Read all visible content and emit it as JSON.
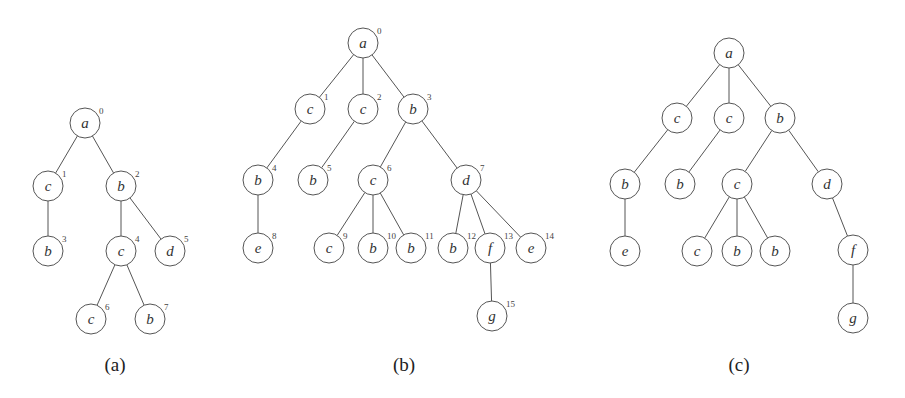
{
  "figure": {
    "node_radius": 15,
    "colors": {
      "stroke": "#555555",
      "text": "#333333",
      "background": "#ffffff"
    },
    "trees": [
      {
        "id": "a",
        "caption": "(a)",
        "caption_pos": [
          115,
          364
        ],
        "nodes": [
          {
            "id": "a0",
            "label": "a",
            "index": "0",
            "x": 85,
            "y": 123
          },
          {
            "id": "a1",
            "label": "c",
            "index": "1",
            "x": 48,
            "y": 186
          },
          {
            "id": "a2",
            "label": "b",
            "index": "2",
            "x": 121,
            "y": 186
          },
          {
            "id": "a3",
            "label": "b",
            "index": "3",
            "x": 48,
            "y": 251
          },
          {
            "id": "a4",
            "label": "c",
            "index": "4",
            "x": 121,
            "y": 251
          },
          {
            "id": "a5",
            "label": "d",
            "index": "5",
            "x": 170,
            "y": 251
          },
          {
            "id": "a6",
            "label": "c",
            "index": "6",
            "x": 91,
            "y": 319
          },
          {
            "id": "a7",
            "label": "b",
            "index": "7",
            "x": 150,
            "y": 319
          }
        ],
        "edges": [
          [
            "a0",
            "a1"
          ],
          [
            "a0",
            "a2"
          ],
          [
            "a1",
            "a3"
          ],
          [
            "a2",
            "a4"
          ],
          [
            "a2",
            "a5"
          ],
          [
            "a4",
            "a6"
          ],
          [
            "a4",
            "a7"
          ]
        ]
      },
      {
        "id": "b",
        "caption": "(b)",
        "caption_pos": [
          404,
          364
        ],
        "nodes": [
          {
            "id": "b0",
            "label": "a",
            "index": "0",
            "x": 363,
            "y": 43
          },
          {
            "id": "b1",
            "label": "c",
            "index": "1",
            "x": 310,
            "y": 109
          },
          {
            "id": "b2",
            "label": "c",
            "index": "2",
            "x": 363,
            "y": 109
          },
          {
            "id": "b3",
            "label": "b",
            "index": "3",
            "x": 413,
            "y": 109
          },
          {
            "id": "b4",
            "label": "b",
            "index": "4",
            "x": 258,
            "y": 180
          },
          {
            "id": "b5",
            "label": "b",
            "index": "5",
            "x": 313,
            "y": 180
          },
          {
            "id": "b6",
            "label": "c",
            "index": "6",
            "x": 373,
            "y": 180
          },
          {
            "id": "b7",
            "label": "d",
            "index": "7",
            "x": 466,
            "y": 180
          },
          {
            "id": "b8",
            "label": "e",
            "index": "8",
            "x": 258,
            "y": 248
          },
          {
            "id": "b9",
            "label": "c",
            "index": "9",
            "x": 329,
            "y": 248
          },
          {
            "id": "b10",
            "label": "b",
            "index": "10",
            "x": 373,
            "y": 248
          },
          {
            "id": "b11",
            "label": "b",
            "index": "11",
            "x": 411,
            "y": 248
          },
          {
            "id": "b12",
            "label": "b",
            "index": "12",
            "x": 453,
            "y": 248
          },
          {
            "id": "b13",
            "label": "f",
            "index": "13",
            "x": 490,
            "y": 248
          },
          {
            "id": "b14",
            "label": "e",
            "index": "14",
            "x": 531,
            "y": 248
          },
          {
            "id": "b15",
            "label": "g",
            "index": "15",
            "x": 492,
            "y": 316
          }
        ],
        "edges": [
          [
            "b0",
            "b1"
          ],
          [
            "b0",
            "b2"
          ],
          [
            "b0",
            "b3"
          ],
          [
            "b1",
            "b4"
          ],
          [
            "b2",
            "b5"
          ],
          [
            "b3",
            "b6"
          ],
          [
            "b3",
            "b7"
          ],
          [
            "b4",
            "b8"
          ],
          [
            "b6",
            "b9"
          ],
          [
            "b6",
            "b10"
          ],
          [
            "b6",
            "b11"
          ],
          [
            "b7",
            "b12"
          ],
          [
            "b7",
            "b13"
          ],
          [
            "b7",
            "b14"
          ],
          [
            "b13",
            "b15"
          ]
        ]
      },
      {
        "id": "c",
        "caption": "(c)",
        "caption_pos": [
          739,
          364
        ],
        "nodes": [
          {
            "id": "c0",
            "label": "a",
            "index": "",
            "x": 729,
            "y": 53
          },
          {
            "id": "c1",
            "label": "c",
            "index": "",
            "x": 677,
            "y": 118
          },
          {
            "id": "c2",
            "label": "c",
            "index": "",
            "x": 729,
            "y": 118
          },
          {
            "id": "c3",
            "label": "b",
            "index": "",
            "x": 780,
            "y": 118
          },
          {
            "id": "c4",
            "label": "b",
            "index": "",
            "x": 625,
            "y": 184
          },
          {
            "id": "c5",
            "label": "b",
            "index": "",
            "x": 680,
            "y": 184
          },
          {
            "id": "c6",
            "label": "c",
            "index": "",
            "x": 737,
            "y": 184
          },
          {
            "id": "c7",
            "label": "d",
            "index": "",
            "x": 827,
            "y": 184
          },
          {
            "id": "c8",
            "label": "e",
            "index": "",
            "x": 625,
            "y": 251
          },
          {
            "id": "c9",
            "label": "c",
            "index": "",
            "x": 697,
            "y": 251
          },
          {
            "id": "c10",
            "label": "b",
            "index": "",
            "x": 737,
            "y": 251
          },
          {
            "id": "c11",
            "label": "b",
            "index": "",
            "x": 775,
            "y": 251
          },
          {
            "id": "c12",
            "label": "f",
            "index": "",
            "x": 853,
            "y": 250
          },
          {
            "id": "c13",
            "label": "g",
            "index": "",
            "x": 853,
            "y": 318
          }
        ],
        "edges": [
          [
            "c0",
            "c1"
          ],
          [
            "c0",
            "c2"
          ],
          [
            "c0",
            "c3"
          ],
          [
            "c1",
            "c4"
          ],
          [
            "c2",
            "c5"
          ],
          [
            "c3",
            "c6"
          ],
          [
            "c3",
            "c7"
          ],
          [
            "c4",
            "c8"
          ],
          [
            "c6",
            "c9"
          ],
          [
            "c6",
            "c10"
          ],
          [
            "c6",
            "c11"
          ],
          [
            "c7",
            "c12"
          ],
          [
            "c12",
            "c13"
          ]
        ]
      }
    ]
  }
}
